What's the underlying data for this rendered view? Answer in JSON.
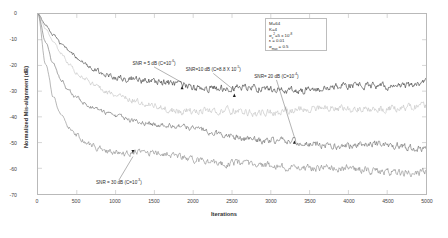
{
  "chart_data": {
    "type": "line",
    "title": "",
    "xlabel": "Iterations",
    "ylabel": "Normalized Mis-alignment (dB)",
    "xlim": [
      0,
      5000
    ],
    "ylim": [
      -70,
      0
    ],
    "xticks": [
      0,
      500,
      1000,
      1500,
      2000,
      2500,
      3000,
      3500,
      4000,
      4500,
      5000
    ],
    "yticks": [
      0,
      -10,
      -20,
      -30,
      -40,
      -50,
      -60,
      -70
    ],
    "grid": false,
    "legend_position": "upper-right-inset",
    "series": [
      {
        "name": "SNR = 5 dB",
        "color": "#3b3b3b",
        "steady_state_db": -28,
        "x": [
          0,
          100,
          200,
          300,
          400,
          500,
          600,
          700,
          800,
          900,
          1000,
          1200,
          1400,
          1600,
          1800,
          2000,
          2500,
          3000,
          3500,
          4000,
          4500,
          5000
        ],
        "values": [
          0,
          -4.5,
          -8.5,
          -12.0,
          -15.0,
          -17.5,
          -19.6,
          -21.4,
          -22.9,
          -24.1,
          -25.1,
          -26.5,
          -27.2,
          -27.9,
          -28.2,
          -28.5,
          -28.3,
          -28.6,
          -28.2,
          -28.0,
          -27.9,
          -27.7
        ]
      },
      {
        "name": "SNR = 10 dB",
        "color": "#c2c2c2",
        "steady_state_db": -37,
        "x": [
          0,
          100,
          200,
          300,
          400,
          500,
          600,
          700,
          800,
          900,
          1000,
          1200,
          1400,
          1600,
          1800,
          2000,
          2500,
          3000,
          3500,
          4000,
          4500,
          5000
        ],
        "values": [
          0,
          -6.0,
          -11.3,
          -15.8,
          -19.6,
          -22.8,
          -25.4,
          -27.6,
          -29.4,
          -30.9,
          -32.1,
          -33.9,
          -35.1,
          -35.9,
          -36.4,
          -36.8,
          -37.0,
          -37.2,
          -37.1,
          -37.3,
          -37.6,
          -37.4
        ]
      },
      {
        "name": "SNR = 20 dB",
        "color": "#6d6d6d",
        "steady_state_db": -52,
        "x": [
          0,
          100,
          200,
          300,
          400,
          500,
          600,
          700,
          800,
          900,
          1000,
          1200,
          1400,
          1600,
          1800,
          2000,
          2500,
          3000,
          3500,
          4000,
          4500,
          5000
        ],
        "values": [
          0,
          -11.0,
          -19.5,
          -25.6,
          -29.8,
          -32.7,
          -34.8,
          -36.3,
          -37.5,
          -38.4,
          -39.2,
          -40.4,
          -41.4,
          -42.3,
          -43.2,
          -44.2,
          -47.4,
          -50.0,
          -51.2,
          -51.8,
          -51.5,
          -52.3
        ]
      },
      {
        "name": "SNR = 30 dB",
        "color": "#8a8a8a",
        "steady_state_db": -60,
        "x": [
          0,
          100,
          200,
          300,
          400,
          500,
          600,
          700,
          800,
          900,
          1000,
          1200,
          1400,
          1600,
          1800,
          2000,
          2500,
          3000,
          3500,
          4000,
          4500,
          5000
        ],
        "values": [
          0,
          -19.5,
          -32.0,
          -39.0,
          -43.5,
          -46.6,
          -48.7,
          -50.2,
          -51.3,
          -52.1,
          -52.7,
          -53.4,
          -53.9,
          -54.6,
          -55.5,
          -56.6,
          -59.2,
          -60.1,
          -59.9,
          -60.4,
          -60.2,
          -60.6
        ]
      }
    ],
    "annotations": [
      {
        "text": "SNR = 5 dB (C=10",
        "sup": "-6",
        "tail": ")",
        "x_iter": 1500,
        "y_db": -19.5,
        "point_x_iter": 1860,
        "point_y_db": -28.0
      },
      {
        "text": "SNR=10 dB (C=8.8 X 10",
        "sup": "-5",
        "tail": ")",
        "x_iter": 2260,
        "y_db": -22.0,
        "point_x_iter": 2530,
        "point_y_db": -31.0
      },
      {
        "text": "SNR= 20 dB (C=10",
        "sup": "-4",
        "tail": ")",
        "x_iter": 3070,
        "y_db": -24.5,
        "point_x_iter": 3300,
        "point_y_db": -49.0
      },
      {
        "text": "SNR = 30 dB (C=10",
        "sup": "-3",
        "tail": ")",
        "x_iter": 1050,
        "y_db": -65.5,
        "point_x_iter": 1230,
        "point_y_db": -54.0
      }
    ],
    "legend_lines": [
      {
        "text": "M=64"
      },
      {
        "text": "K=4"
      },
      {
        "pre": "σ",
        "sub": "v",
        "sup2": "2",
        "mid": "=5 x 10",
        "sup": "-8"
      },
      {
        "pre": "ε",
        "mid": " = 0.01"
      },
      {
        "pre": "σ",
        "sub": "max",
        "mid": " = 0.5"
      }
    ]
  }
}
